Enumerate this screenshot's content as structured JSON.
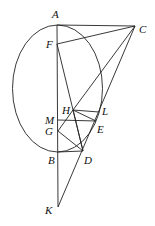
{
  "figure": {
    "points": {
      "A": {
        "label": "A",
        "x": 57,
        "y": 25,
        "lx": 52,
        "ly": 18
      },
      "C": {
        "label": "C",
        "x": 135,
        "y": 26,
        "lx": 139,
        "ly": 33
      },
      "F": {
        "label": "F",
        "x": 57,
        "y": 44,
        "lx": 46,
        "ly": 48
      },
      "H": {
        "label": "H",
        "x": 73,
        "y": 110,
        "lx": 62,
        "ly": 114
      },
      "L": {
        "label": "L",
        "x": 99,
        "y": 112,
        "lx": 102,
        "ly": 115
      },
      "M": {
        "label": "M",
        "x": 58,
        "y": 120,
        "lx": 45,
        "ly": 124
      },
      "E": {
        "label": "E",
        "x": 96,
        "y": 121,
        "lx": 97,
        "ly": 133
      },
      "G": {
        "label": "G",
        "x": 58,
        "y": 131,
        "lx": 45,
        "ly": 135
      },
      "B": {
        "label": "B",
        "x": 58,
        "y": 152,
        "lx": 48,
        "ly": 164
      },
      "D": {
        "label": "D",
        "x": 83,
        "y": 151,
        "lx": 84,
        "ly": 164
      },
      "K": {
        "label": "K",
        "x": 58,
        "y": 207,
        "lx": 45,
        "ly": 214
      }
    },
    "ellipse": {
      "cx": 57.5,
      "cy": 88.5,
      "rx": 45,
      "ry": 63.5
    },
    "segments": [
      [
        "A",
        "C"
      ],
      [
        "F",
        "C"
      ],
      [
        "H",
        "C"
      ],
      [
        "K",
        "C"
      ],
      [
        "A",
        "K"
      ],
      [
        "F",
        "D"
      ],
      [
        "H",
        "L"
      ],
      [
        "H",
        "E"
      ],
      [
        "M",
        "E"
      ],
      [
        "G",
        "H"
      ],
      [
        "G",
        "D"
      ],
      [
        "B",
        "D"
      ],
      [
        "H",
        "D"
      ]
    ]
  }
}
